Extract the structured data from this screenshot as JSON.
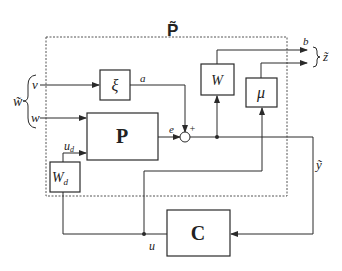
{
  "diagram": {
    "title": "P̃",
    "blocks": {
      "xi": "ξ",
      "P": "P",
      "W": "W",
      "mu": "μ",
      "Wd_main": "W",
      "Wd_sub": "d",
      "C": "C"
    },
    "signals": {
      "w_tilde": "w̃",
      "v": "v",
      "w": "w",
      "a": "a",
      "e": "e",
      "plus": "+",
      "b": "b",
      "z_tilde": "z̃",
      "ud_main": "u",
      "ud_sub": "d",
      "y_tilde": "ỹ",
      "u": "u"
    },
    "colors": {
      "line": "#2a2a2a",
      "dashed_border": "#555555",
      "background": "#ffffff"
    }
  }
}
